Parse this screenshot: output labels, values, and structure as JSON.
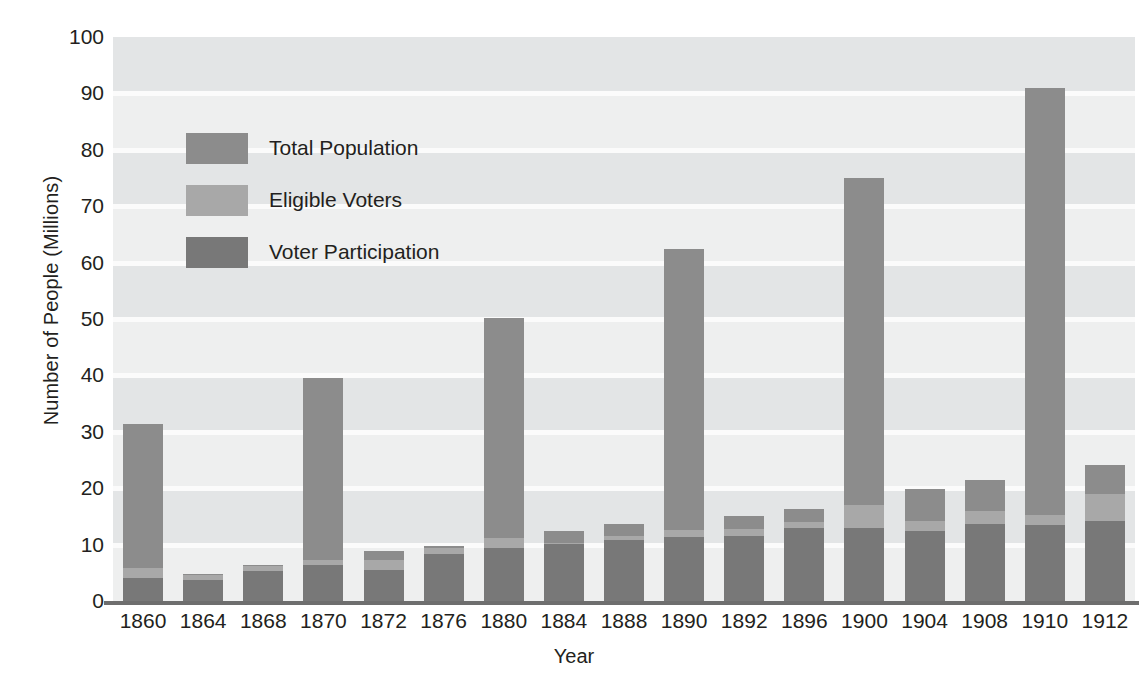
{
  "chart_data": {
    "type": "bar",
    "title": "",
    "xlabel": "Year",
    "ylabel": "Number of People (Millions)",
    "ylim": [
      0,
      100
    ],
    "ytick_step": 10,
    "grid": true,
    "legend_position": "inside-upper-left",
    "stacked_overlay": true,
    "categories": [
      "1860",
      "1864",
      "1868",
      "1870",
      "1872",
      "1876",
      "1880",
      "1884",
      "1888",
      "1890",
      "1892",
      "1896",
      "1900",
      "1904",
      "1908",
      "1910",
      "1912"
    ],
    "yticks": [
      "0",
      "10",
      "20",
      "30",
      "40",
      "50",
      "60",
      "70",
      "80",
      "90",
      "100"
    ],
    "series": [
      {
        "name": "Total Population",
        "color": "#8c8c8c",
        "values": [
          31.3,
          4.8,
          6.4,
          39.6,
          8.9,
          9.8,
          50.2,
          12.4,
          13.7,
          62.5,
          15.1,
          16.4,
          75.0,
          19.8,
          21.4,
          91.0,
          24.1
        ]
      },
      {
        "name": "Eligible Voters",
        "color": "#a8a8a8",
        "values": [
          5.9,
          4.6,
          6.2,
          7.3,
          7.2,
          9.4,
          11.2,
          10.2,
          11.6,
          12.6,
          12.8,
          14.0,
          17.0,
          14.2,
          16.0,
          15.2,
          19.0
        ]
      },
      {
        "name": "Voter Participation",
        "color": "#787878",
        "values": [
          4.1,
          3.7,
          5.3,
          6.3,
          5.5,
          8.3,
          9.4,
          10.1,
          10.9,
          11.4,
          11.6,
          13.0,
          13.0,
          12.4,
          13.7,
          13.5,
          14.2
        ]
      }
    ]
  },
  "legend": {
    "items": [
      {
        "label": "Total Population",
        "color": "#8c8c8c"
      },
      {
        "label": "Eligible Voters",
        "color": "#a8a8a8"
      },
      {
        "label": "Voter Participation",
        "color": "#787878"
      }
    ]
  },
  "axes": {
    "y_title": "Number of People (Millions)",
    "x_title": "Year"
  },
  "colors": {
    "plot_background": "#eeefef",
    "band": "#e3e5e6",
    "gridline": "#fbfbfb",
    "axis": "#6e6e6e",
    "text": "#231f20"
  }
}
